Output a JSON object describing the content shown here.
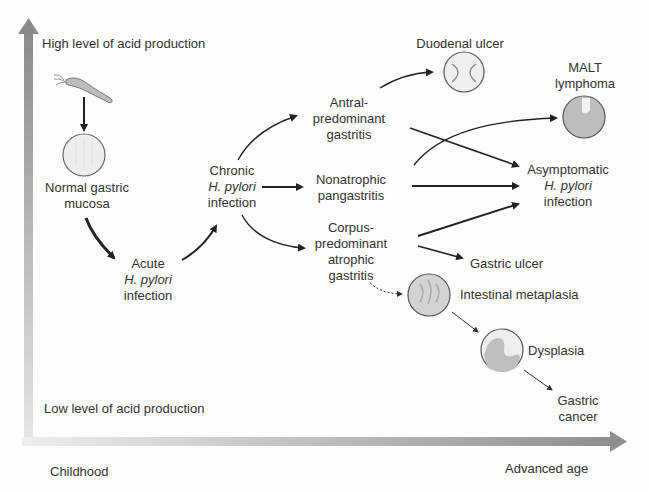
{
  "axes": {
    "y_top": "High level of acid production",
    "y_bottom": "Low level of acid production",
    "x_left": "Childhood",
    "x_right": "Advanced age"
  },
  "nodes": {
    "normal": {
      "line1": "Normal gastric",
      "line2": "mucosa"
    },
    "acute": {
      "line1": "Acute",
      "line2": "H. pylori",
      "line3": "infection"
    },
    "chronic": {
      "line1": "Chronic",
      "line2": "H. pylori",
      "line3": "infection"
    },
    "antral": {
      "line1": "Antral-",
      "line2": "predominant",
      "line3": "gastritis"
    },
    "nonatrophic": {
      "line1": "Nonatrophic",
      "line2": "pangastritis"
    },
    "corpus": {
      "line1": "Corpus-",
      "line2": "predominant",
      "line3": "atrophic",
      "line4": "gastritis"
    },
    "duodenal": {
      "line1": "Duodenal ulcer"
    },
    "malt": {
      "line1": "MALT",
      "line2": "lymphoma"
    },
    "asymptomatic": {
      "line1": "Asymptomatic",
      "line2": "H. pylori",
      "line3": "infection"
    },
    "gastric_ulcer": {
      "line1": "Gastric ulcer"
    },
    "metaplasia": {
      "line1": "Intestinal metaplasia"
    },
    "dysplasia": {
      "line1": "Dysplasia"
    },
    "cancer": {
      "line1": "Gastric",
      "line2": "cancer"
    }
  },
  "icons": [
    "h-pylori-bacterium-icon",
    "normal-mucosa-icon",
    "duodenal-ulcer-icon",
    "malt-lymphoma-icon",
    "intestinal-metaplasia-icon",
    "dysplasia-icon"
  ]
}
